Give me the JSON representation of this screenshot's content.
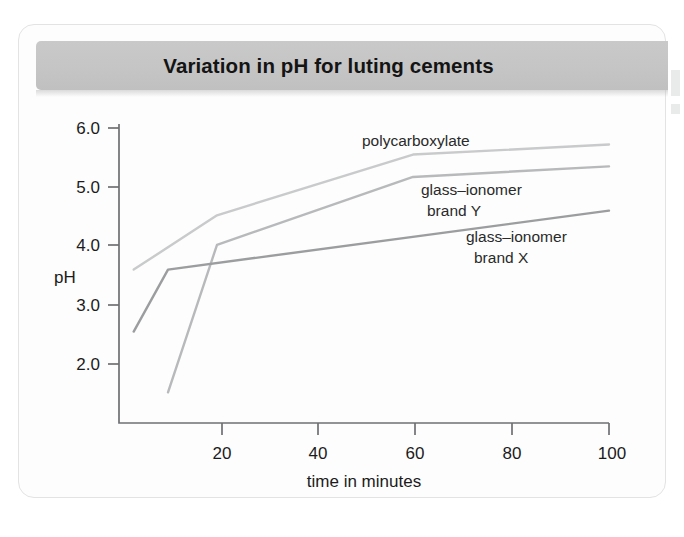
{
  "figure": {
    "title": "Variation in pH for luting cements"
  },
  "chart_data": {
    "type": "line",
    "title": "Variation in pH for luting cements",
    "xlabel": "time in minutes",
    "ylabel": "pH",
    "xlim": [
      0,
      100
    ],
    "ylim": [
      1.3,
      6.0
    ],
    "xticks": [
      20,
      40,
      60,
      80,
      100
    ],
    "xtick_labels": [
      "20",
      "40",
      "60",
      "80",
      "100"
    ],
    "yticks": [
      2.0,
      3.0,
      4.0,
      5.0,
      6.0
    ],
    "ytick_labels": [
      "2.0",
      "3.0",
      "4.0",
      "5.0",
      "6.0"
    ],
    "grid": false,
    "legend": "inline-annotations",
    "series": [
      {
        "name": "polycarboxylate",
        "color": "#c9cacb",
        "x": [
          3,
          20,
          60,
          100
        ],
        "y": [
          3.6,
          4.52,
          5.55,
          5.72
        ]
      },
      {
        "name": "glass–ionomer brand Y",
        "color": "#b7b9bb",
        "x": [
          10,
          20,
          60,
          100
        ],
        "y": [
          1.52,
          4.02,
          5.17,
          5.35
        ]
      },
      {
        "name": "glass–ionomer brand X",
        "color": "#9b9d9f",
        "x": [
          3,
          10,
          100
        ],
        "y": [
          2.55,
          3.6,
          4.6
        ]
      }
    ],
    "annotations": [
      {
        "text": "polycarboxylate",
        "x": 44,
        "y": 5.82
      },
      {
        "text": "glass–ionomer",
        "x": 61,
        "y": 5.02
      },
      {
        "text": "brand Y",
        "x": 61,
        "y": 4.72
      },
      {
        "text": "glass–ionomer",
        "x": 72,
        "y": 4.22
      },
      {
        "text": "brand X",
        "x": 72,
        "y": 3.92
      }
    ]
  },
  "axes": {
    "y_label": "pH",
    "x_label": "time in minutes",
    "y_ticks": [
      "6.0",
      "5.0",
      "4.0",
      "3.0",
      "2.0"
    ],
    "x_ticks": [
      "20",
      "40",
      "60",
      "80",
      "100"
    ]
  },
  "series_labels": {
    "poly": "polycarboxylate",
    "giY_line1": "glass–ionomer",
    "giY_line2": "brand Y",
    "giX_line1": "glass–ionomer",
    "giX_line2": "brand X"
  },
  "colors": {
    "banner": "#c5c5c5",
    "title_text": "#141414",
    "axis": "#6f7072",
    "poly": "#c9cacb",
    "giY": "#b7b9bb",
    "giX": "#9b9d9f"
  }
}
